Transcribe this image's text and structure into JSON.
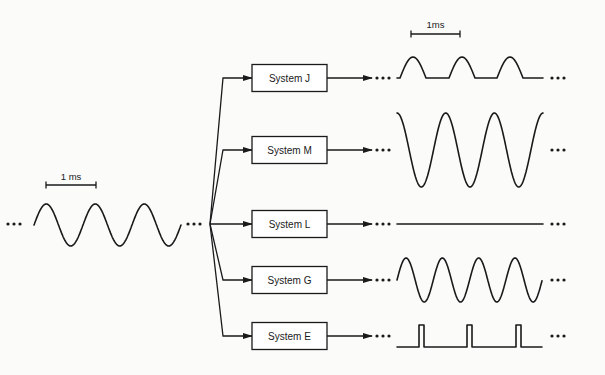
{
  "diagram": {
    "title": "",
    "input": {
      "label": "input-signal",
      "waveform": "sine",
      "scale_bar_label": "1 ms",
      "x_start": 34,
      "x_end": 181,
      "center_y": 225,
      "amplitude": 21,
      "period_px": 49,
      "scale_bar": {
        "x1": 46,
        "x2": 96,
        "y": 185
      }
    },
    "fanout_point": {
      "x": 210,
      "y": 224
    },
    "systems": [
      {
        "id": "J",
        "label": "System J",
        "center_y": 78,
        "output": {
          "type": "half-wave-rectified",
          "baseline_y": 78,
          "peak_y": 57,
          "x_start": 397,
          "x_end": 543,
          "hump_starts": [
            400,
            449,
            497
          ],
          "hump_width": 26
        },
        "scale_bar_label": "1ms",
        "scale_bar": {
          "x1": 411,
          "x2": 460,
          "y": 34
        }
      },
      {
        "id": "M",
        "label": "System M",
        "center_y": 150,
        "output": {
          "type": "cosine-amplified",
          "center_y": 150,
          "amplitude": 37,
          "x_start": 397,
          "x_end": 543,
          "period_px": 48.7
        }
      },
      {
        "id": "L",
        "label": "System L",
        "center_y": 224,
        "output": {
          "type": "flat",
          "y": 224,
          "x_start": 397,
          "x_end": 543
        }
      },
      {
        "id": "G",
        "label": "System G",
        "center_y": 280,
        "output": {
          "type": "sine-higher-frequency",
          "center_y": 280,
          "amplitude": 22,
          "x_start": 397,
          "x_end": 542,
          "period_px": 36.3
        }
      },
      {
        "id": "E",
        "label": "System E",
        "center_y": 336,
        "output": {
          "type": "pulse-train",
          "baseline_y": 347,
          "top_y": 325,
          "x_start": 397,
          "x_end": 542,
          "pulses": [
            [
              419,
              424
            ],
            [
              467,
              472
            ],
            [
              516,
              521
            ]
          ]
        }
      }
    ],
    "box": {
      "x": 252,
      "width": 75,
      "height": 27
    },
    "ellipsis": "•••",
    "colors": {
      "ink": "#1a1a1a",
      "background": "#fbfbfa"
    }
  }
}
